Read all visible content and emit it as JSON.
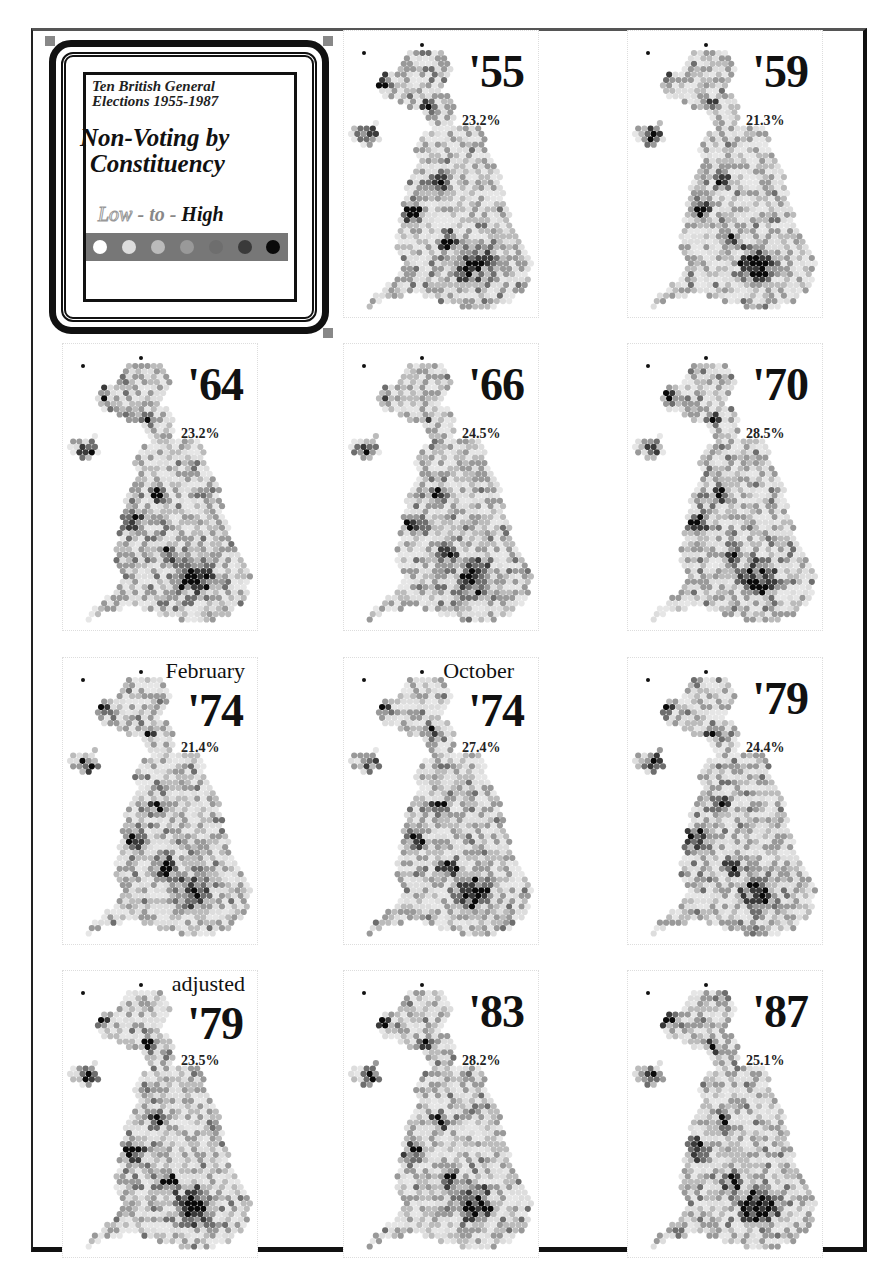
{
  "legend": {
    "subtitle_line1": "Ten British General",
    "subtitle_line2": "Elections 1955-1987",
    "title_line1": "Non-Voting by",
    "title_line2": "Constituency",
    "scale_low": "Low",
    "scale_to": " - to - ",
    "scale_high": "High",
    "scale_colors": [
      "#ffffff",
      "#dddddd",
      "#bbbbbb",
      "#999999",
      "#6e6e6e",
      "#3a3a3a",
      "#0a0a0a"
    ]
  },
  "panels": [
    {
      "id": "p1955",
      "label": "'55",
      "prefix": "",
      "pct": "23.2%"
    },
    {
      "id": "p1959",
      "label": "'59",
      "prefix": "",
      "pct": "21.3%"
    },
    {
      "id": "p1964",
      "label": "'64",
      "prefix": "",
      "pct": "23.2%"
    },
    {
      "id": "p1966",
      "label": "'66",
      "prefix": "",
      "pct": "24.5%"
    },
    {
      "id": "p1970",
      "label": "'70",
      "prefix": "",
      "pct": "28.5%"
    },
    {
      "id": "p1974f",
      "label": "'74",
      "prefix": "February",
      "pct": "21.4%"
    },
    {
      "id": "p1974o",
      "label": "'74",
      "prefix": "October",
      "pct": "27.4%"
    },
    {
      "id": "p1979",
      "label": "'79",
      "prefix": "",
      "pct": "24.4%"
    },
    {
      "id": "p1979a",
      "label": "'79",
      "prefix": "adjusted",
      "pct": "23.5%"
    },
    {
      "id": "p1983",
      "label": "'83",
      "prefix": "",
      "pct": "28.2%"
    },
    {
      "id": "p1987",
      "label": "'87",
      "prefix": "",
      "pct": "25.1%"
    }
  ],
  "chart_data": {
    "type": "heatmap",
    "legend": {
      "label": "Low - to - High",
      "levels": 7,
      "position": "top-left"
    },
    "categories": [
      "1955",
      "1959",
      "1964",
      "1966",
      "1970",
      "Feb 1974",
      "Oct 1974",
      "1979",
      "1979 adjusted",
      "1983",
      "1987"
    ],
    "series": [
      {
        "name": "National non-voting rate (%)",
        "values": [
          23.2,
          21.3,
          23.2,
          24.5,
          28.5,
          21.4,
          27.4,
          24.4,
          23.5,
          28.2,
          25.1
        ]
      }
    ],
    "grid": false,
    "layout": "small multiples, 3 columns x 4 rows, legend in first cell"
  }
}
